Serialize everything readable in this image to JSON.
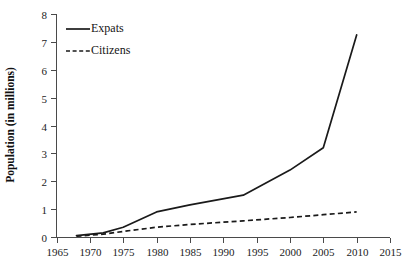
{
  "chart_data": {
    "type": "line",
    "title": "",
    "xlabel": "",
    "ylabel": "Population (in millions)",
    "xlim": [
      1965,
      2015
    ],
    "ylim": [
      0,
      8
    ],
    "grid": false,
    "legend_position": "upper-left-inside",
    "x_ticks": [
      1965,
      1970,
      1975,
      1980,
      1985,
      1990,
      1995,
      2000,
      2005,
      2010,
      2015
    ],
    "y_ticks": [
      0,
      1,
      2,
      3,
      4,
      5,
      6,
      7,
      8
    ],
    "series": [
      {
        "name": "Expats",
        "style": "solid",
        "color": "#1a1a1a",
        "x": [
          1968,
          1972,
          1975,
          1980,
          1985,
          1993,
          2000,
          2005,
          2010
        ],
        "values": [
          0.05,
          0.15,
          0.35,
          0.9,
          1.15,
          1.5,
          2.4,
          3.2,
          7.25
        ]
      },
      {
        "name": "Citizens",
        "style": "dashed",
        "color": "#1a1a1a",
        "x": [
          1968,
          1972,
          1975,
          1980,
          1985,
          1993,
          2000,
          2005,
          2010
        ],
        "values": [
          0.03,
          0.1,
          0.2,
          0.35,
          0.45,
          0.58,
          0.7,
          0.8,
          0.9
        ]
      }
    ]
  },
  "axis": {
    "y_title": "Population (in millions)",
    "y_tick_labels": [
      "0",
      "1",
      "2",
      "3",
      "4",
      "5",
      "6",
      "7",
      "8"
    ],
    "x_tick_labels": [
      "1965",
      "1970",
      "1975",
      "1980",
      "1985",
      "1990",
      "1995",
      "2000",
      "2005",
      "2010",
      "2015"
    ]
  },
  "legend": {
    "items": [
      {
        "label": "Expats",
        "style": "solid"
      },
      {
        "label": "Citizens",
        "style": "dashed"
      }
    ]
  }
}
